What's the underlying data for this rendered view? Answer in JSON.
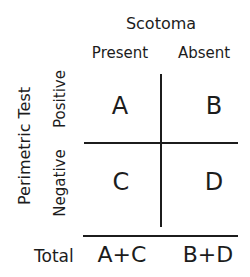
{
  "title": "Scotoma",
  "columns": [
    "Present",
    "Absent"
  ],
  "row_axis_label": "Perimetric Test",
  "rows": [
    "Positive",
    "Negative"
  ],
  "cells": [
    [
      "A",
      "B"
    ],
    [
      "C",
      "D"
    ]
  ],
  "totals": {
    "label": "Total",
    "values": [
      "A+C",
      "B+D"
    ]
  }
}
